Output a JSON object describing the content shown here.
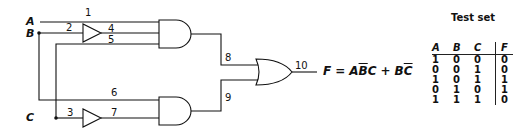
{
  "inputs": {
    "a": "A",
    "b": "B",
    "c": "C"
  },
  "wire_labels": {
    "w1": "1",
    "w2": "2",
    "w3": "3",
    "w4": "4",
    "w5": "5",
    "w6": "6",
    "w7": "7",
    "w8": "8",
    "w9": "9",
    "w10": "10"
  },
  "gates": [
    {
      "id": "buffer-1",
      "type": "buffer",
      "input": "2",
      "output": "4"
    },
    {
      "id": "buffer-2",
      "type": "buffer",
      "input": "3",
      "output": "7"
    },
    {
      "id": "and-1",
      "type": "and",
      "inputs": [
        "1",
        "4",
        "5"
      ],
      "output": "8"
    },
    {
      "id": "and-2",
      "type": "and",
      "inputs": [
        "6",
        "7"
      ],
      "output": "9"
    },
    {
      "id": "or-1",
      "type": "or",
      "inputs": [
        "8",
        "9"
      ],
      "output": "10"
    }
  ],
  "equation": {
    "lhs": "F",
    "equals": "=",
    "term1_a": "A",
    "term1_b_bar": "B",
    "term1_c": "C",
    "plus": "+",
    "term2_b": "B",
    "term2_c_bar": "C"
  },
  "test_set": {
    "title": "Test set",
    "headers": [
      "A",
      "B",
      "C",
      "F"
    ],
    "rows": [
      [
        "1",
        "0",
        "0",
        "0"
      ],
      [
        "0",
        "0",
        "1",
        "0"
      ],
      [
        "1",
        "0",
        "1",
        "1"
      ],
      [
        "0",
        "1",
        "0",
        "1"
      ],
      [
        "1",
        "1",
        "1",
        "0"
      ]
    ]
  }
}
